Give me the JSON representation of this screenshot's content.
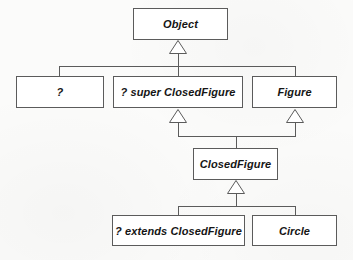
{
  "diagram": {
    "type": "uml-class-hierarchy",
    "background_color": "#fbfbfa",
    "box_fill_color": "#ffffff",
    "line_color": "#5b5b5b",
    "text_color": "#151515",
    "nodes": [
      {
        "id": "object",
        "label": "Object",
        "x": 133,
        "y": 8,
        "w": 95,
        "h": 32
      },
      {
        "id": "wildcard",
        "label": "?",
        "x": 16,
        "y": 76,
        "w": 88,
        "h": 32
      },
      {
        "id": "super-closedfigure",
        "label": "? super ClosedFigure",
        "x": 113,
        "y": 76,
        "w": 130,
        "h": 32
      },
      {
        "id": "figure",
        "label": "Figure",
        "x": 252,
        "y": 76,
        "w": 85,
        "h": 32
      },
      {
        "id": "closedfigure",
        "label": "ClosedFigure",
        "x": 193,
        "y": 148,
        "w": 85,
        "h": 32
      },
      {
        "id": "extends-closedfigure",
        "label": "? extends ClosedFigure",
        "x": 112,
        "y": 215,
        "w": 133,
        "h": 31
      },
      {
        "id": "circle",
        "label": "Circle",
        "x": 252,
        "y": 215,
        "w": 85,
        "h": 31
      }
    ],
    "edges": [
      {
        "from": "wildcard",
        "to": "object",
        "kind": "generalization"
      },
      {
        "from": "super-closedfigure",
        "to": "object",
        "kind": "generalization"
      },
      {
        "from": "figure",
        "to": "object",
        "kind": "generalization"
      },
      {
        "from": "closedfigure",
        "to": "super-closedfigure",
        "kind": "generalization"
      },
      {
        "from": "closedfigure",
        "to": "figure",
        "kind": "generalization"
      },
      {
        "from": "extends-closedfigure",
        "to": "closedfigure",
        "kind": "generalization"
      },
      {
        "from": "circle",
        "to": "closedfigure",
        "kind": "generalization"
      }
    ],
    "arrowheads": [
      {
        "id": "to-object",
        "apex_x": 178,
        "apex_y": 40,
        "half_width": 9,
        "height": 13
      },
      {
        "id": "to-super-closed",
        "apex_x": 178,
        "apex_y": 109,
        "half_width": 9,
        "height": 13
      },
      {
        "id": "to-figure",
        "apex_x": 295,
        "apex_y": 109,
        "half_width": 9,
        "height": 13
      },
      {
        "id": "to-closedfigure",
        "apex_x": 236,
        "apex_y": 180,
        "half_width": 9,
        "height": 13
      }
    ]
  }
}
